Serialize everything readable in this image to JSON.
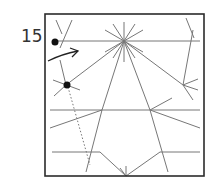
{
  "diagram": {
    "step_number": "15",
    "colors": {
      "border": "#2b2b2b",
      "crease": "#777777",
      "dot": "#111111",
      "arrow": "#222222"
    },
    "square": {
      "x": 45,
      "y": 14,
      "w": 159,
      "h": 162
    },
    "creases": [
      {
        "x1": 55,
        "y1": 41,
        "x2": 200,
        "y2": 41
      },
      {
        "x1": 50,
        "y1": 110,
        "x2": 200,
        "y2": 110
      },
      {
        "x1": 52,
        "y1": 152,
        "x2": 100,
        "y2": 152
      },
      {
        "x1": 160,
        "y1": 152,
        "x2": 200,
        "y2": 152
      },
      {
        "x1": 124,
        "y1": 41,
        "x2": 66,
        "y2": 85
      },
      {
        "x1": 124,
        "y1": 41,
        "x2": 102,
        "y2": 110
      },
      {
        "x1": 102,
        "y1": 110,
        "x2": 86,
        "y2": 172
      },
      {
        "x1": 124,
        "y1": 41,
        "x2": 150,
        "y2": 110
      },
      {
        "x1": 150,
        "y1": 110,
        "x2": 168,
        "y2": 172
      },
      {
        "x1": 124,
        "y1": 41,
        "x2": 183,
        "y2": 85
      },
      {
        "x1": 124,
        "y1": 22,
        "x2": 124,
        "y2": 62
      },
      {
        "x1": 113,
        "y1": 24,
        "x2": 135,
        "y2": 58
      },
      {
        "x1": 135,
        "y1": 24,
        "x2": 113,
        "y2": 58
      },
      {
        "x1": 105,
        "y1": 30,
        "x2": 143,
        "y2": 52
      },
      {
        "x1": 143,
        "y1": 30,
        "x2": 105,
        "y2": 52
      },
      {
        "x1": 60,
        "y1": 60,
        "x2": 66,
        "y2": 85
      },
      {
        "x1": 53,
        "y1": 80,
        "x2": 80,
        "y2": 90
      },
      {
        "x1": 54,
        "y1": 96,
        "x2": 66,
        "y2": 85
      },
      {
        "x1": 50,
        "y1": 128,
        "x2": 102,
        "y2": 110
      },
      {
        "x1": 150,
        "y1": 110,
        "x2": 200,
        "y2": 128
      },
      {
        "x1": 150,
        "y1": 110,
        "x2": 172,
        "y2": 98
      },
      {
        "x1": 183,
        "y1": 85,
        "x2": 193,
        "y2": 30
      },
      {
        "x1": 183,
        "y1": 85,
        "x2": 198,
        "y2": 79
      },
      {
        "x1": 183,
        "y1": 85,
        "x2": 198,
        "y2": 90
      },
      {
        "x1": 183,
        "y1": 85,
        "x2": 193,
        "y2": 100
      },
      {
        "x1": 100,
        "y1": 152,
        "x2": 126,
        "y2": 176
      },
      {
        "x1": 160,
        "y1": 152,
        "x2": 126,
        "y2": 176
      },
      {
        "x1": 126,
        "y1": 166,
        "x2": 126,
        "y2": 176
      },
      {
        "x1": 120,
        "y1": 168,
        "x2": 126,
        "y2": 176
      },
      {
        "x1": 56,
        "y1": 20,
        "x2": 62,
        "y2": 34
      },
      {
        "x1": 72,
        "y1": 20,
        "x2": 60,
        "y2": 48
      },
      {
        "x1": 186,
        "y1": 18,
        "x2": 194,
        "y2": 38
      }
    ],
    "dashed_line": {
      "points": "52,16 58,42 64,68 70,92 78,118 84,140 90,165",
      "style": "dash-dot"
    },
    "dotted_line": {
      "x1": 68,
      "y1": 87,
      "x2": 90,
      "y2": 165
    },
    "dots": [
      {
        "cx": 55,
        "cy": 42,
        "r": 3.5
      },
      {
        "cx": 67,
        "cy": 85,
        "r": 3.5
      }
    ],
    "arrow": {
      "path": "M 48 61 Q 62 54 78 51",
      "head": "M 70 48 L 78 51 L 72 57"
    }
  }
}
